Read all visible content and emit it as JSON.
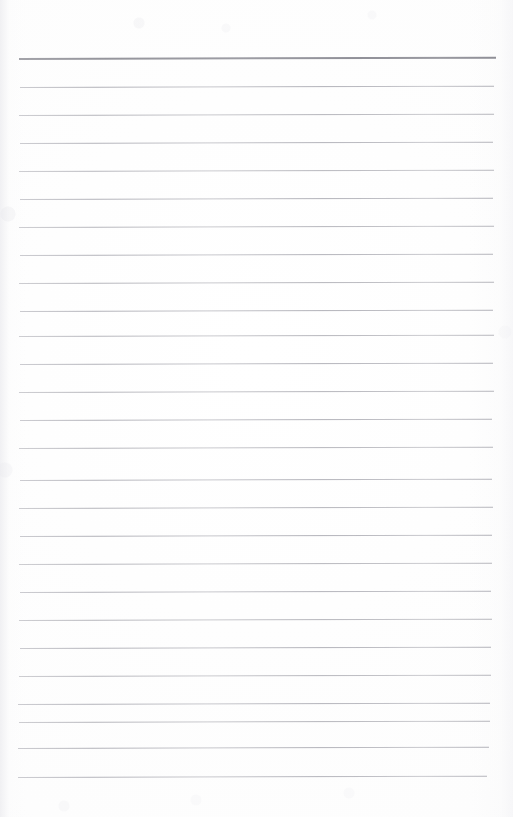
{
  "document": {
    "type": "scanned-lined-notepad-page",
    "title": "Blank lined notepad page",
    "page_text": "",
    "handwriting_present": "none",
    "background_color": "#fdfdfd",
    "page_width": 513,
    "page_height": 817
  },
  "ruling": {
    "style": "wide-ruled horizontal lines",
    "line_color": "#b8b8be",
    "header_rule_color": "#95959c",
    "line_count": 26,
    "line_spacing_px": 28,
    "first_line_y": 58,
    "last_line_y": 777,
    "left_margin_x": 18,
    "right_margin_x": 496,
    "vertical_margin_rule": "none",
    "skew_note": "lines rise slightly toward the right edge",
    "lines": [
      {
        "index": 1,
        "y": 58,
        "x1": 19,
        "x2": 496,
        "weight": "heavy",
        "tone": "#95959c"
      },
      {
        "index": 2,
        "y": 87,
        "x1": 20,
        "x2": 494,
        "weight": "light",
        "tone": "#b1b1b8"
      },
      {
        "index": 3,
        "y": 115,
        "x1": 19,
        "x2": 494,
        "weight": "light",
        "tone": "#b5b5bb"
      },
      {
        "index": 4,
        "y": 143,
        "x1": 20,
        "x2": 493,
        "weight": "light",
        "tone": "#b3b3ba"
      },
      {
        "index": 5,
        "y": 171,
        "x1": 19,
        "x2": 494,
        "weight": "light",
        "tone": "#b7b7bd"
      },
      {
        "index": 6,
        "y": 199,
        "x1": 20,
        "x2": 493,
        "weight": "light",
        "tone": "#b2b2b9"
      },
      {
        "index": 7,
        "y": 227,
        "x1": 19,
        "x2": 494,
        "weight": "light",
        "tone": "#b6b6bc"
      },
      {
        "index": 8,
        "y": 255,
        "x1": 20,
        "x2": 493,
        "weight": "light",
        "tone": "#b3b3ba"
      },
      {
        "index": 9,
        "y": 283,
        "x1": 19,
        "x2": 494,
        "weight": "light",
        "tone": "#b5b5bb"
      },
      {
        "index": 10,
        "y": 311,
        "x1": 20,
        "x2": 493,
        "weight": "light",
        "tone": "#b1b1b8"
      },
      {
        "index": 11,
        "y": 336,
        "x1": 19,
        "x2": 494,
        "weight": "light",
        "tone": "#b6b6bc"
      },
      {
        "index": 12,
        "y": 364,
        "x1": 20,
        "x2": 493,
        "weight": "light",
        "tone": "#b3b3ba"
      },
      {
        "index": 13,
        "y": 392,
        "x1": 19,
        "x2": 494,
        "weight": "light",
        "tone": "#b5b5bb"
      },
      {
        "index": 14,
        "y": 420,
        "x1": 20,
        "x2": 492,
        "weight": "light",
        "tone": "#b2b2b9"
      },
      {
        "index": 15,
        "y": 448,
        "x1": 19,
        "x2": 493,
        "weight": "light",
        "tone": "#b6b6bc"
      },
      {
        "index": 16,
        "y": 480,
        "x1": 20,
        "x2": 492,
        "weight": "light",
        "tone": "#b3b3ba"
      },
      {
        "index": 17,
        "y": 508,
        "x1": 19,
        "x2": 493,
        "weight": "light",
        "tone": "#b5b5bb"
      },
      {
        "index": 18,
        "y": 536,
        "x1": 20,
        "x2": 492,
        "weight": "light",
        "tone": "#b1b1b8"
      },
      {
        "index": 19,
        "y": 564,
        "x1": 19,
        "x2": 492,
        "weight": "light",
        "tone": "#b6b6bc"
      },
      {
        "index": 20,
        "y": 592,
        "x1": 20,
        "x2": 491,
        "weight": "light",
        "tone": "#b3b3ba"
      },
      {
        "index": 21,
        "y": 620,
        "x1": 19,
        "x2": 492,
        "weight": "light",
        "tone": "#b5b5bb"
      },
      {
        "index": 22,
        "y": 648,
        "x1": 20,
        "x2": 491,
        "weight": "light",
        "tone": "#b2b2b9"
      },
      {
        "index": 23,
        "y": 676,
        "x1": 19,
        "x2": 491,
        "weight": "light",
        "tone": "#b6b6bc"
      },
      {
        "index": 24,
        "y": 704,
        "x1": 18,
        "x2": 490,
        "weight": "light",
        "tone": "#b3b3ba"
      },
      {
        "index": 25,
        "y": 722,
        "x1": 19,
        "x2": 490,
        "weight": "light",
        "tone": "#b5b5bb"
      },
      {
        "index": 26,
        "y": 748,
        "x1": 18,
        "x2": 489,
        "weight": "light",
        "tone": "#b2b2b9"
      },
      {
        "index": 27,
        "y": 777,
        "x1": 18,
        "x2": 487,
        "weight": "light",
        "tone": "#b4b4bb"
      }
    ]
  },
  "margins": {
    "top_blank_height_px": 58,
    "bottom_blank_height_px": 40
  }
}
